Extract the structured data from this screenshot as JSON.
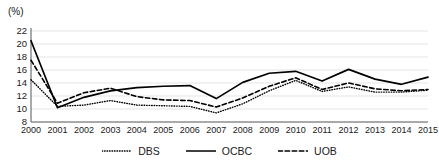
{
  "chart_data": {
    "type": "line",
    "title": "",
    "subtitle": "",
    "xlabel": "",
    "ylabel": "(%)",
    "unit_label": "(%)",
    "x": [
      2000,
      2001,
      2002,
      2003,
      2004,
      2005,
      2006,
      2007,
      2008,
      2009,
      2010,
      2011,
      2012,
      2013,
      2014,
      2015
    ],
    "categories": [
      "2000",
      "2001",
      "2002",
      "2003",
      "2004",
      "2005",
      "2006",
      "2007",
      "2008",
      "2009",
      "2010",
      "2011",
      "2012",
      "2013",
      "2014",
      "2015"
    ],
    "xlim": [
      2000,
      2015
    ],
    "ylim": [
      8,
      22
    ],
    "yticks": [
      8,
      10,
      12,
      14,
      16,
      18,
      20,
      22
    ],
    "ytick_labels": [
      "8",
      "10",
      "12",
      "14",
      "16",
      "18",
      "20",
      "22"
    ],
    "grid": true,
    "grid_axis": "y",
    "legend_position": "bottom",
    "series": [
      {
        "name": "DBS",
        "style": "dotted",
        "color": "#000000",
        "values": [
          14.5,
          10.4,
          10.6,
          11.3,
          10.6,
          10.5,
          10.4,
          9.4,
          10.8,
          12.8,
          14.4,
          12.7,
          13.4,
          12.6,
          12.6,
          12.9
        ]
      },
      {
        "name": "OCBC",
        "style": "solid",
        "color": "#000000",
        "values": [
          20.5,
          10.2,
          11.8,
          12.8,
          13.3,
          13.5,
          13.6,
          11.6,
          14.1,
          15.5,
          15.8,
          14.3,
          16.1,
          14.6,
          13.8,
          14.9
        ]
      },
      {
        "name": "UOB",
        "style": "dashed",
        "color": "#000000",
        "values": [
          17.5,
          10.9,
          12.5,
          13.2,
          11.9,
          11.4,
          11.3,
          10.3,
          11.7,
          13.5,
          14.8,
          13.0,
          14.0,
          13.1,
          12.8,
          13.0
        ]
      }
    ]
  },
  "legend": {
    "items": [
      {
        "label": "DBS",
        "style": "dotted"
      },
      {
        "label": "OCBC",
        "style": "solid"
      },
      {
        "label": "UOB",
        "style": "dashed"
      }
    ]
  }
}
